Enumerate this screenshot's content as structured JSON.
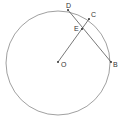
{
  "diagram": {
    "type": "geometry",
    "circle": {
      "center": "O",
      "cx": 58,
      "cy": 63,
      "r": 52,
      "stroke": "#888888"
    },
    "points": [
      {
        "label": "D",
        "x": 68,
        "y": 10,
        "lx": 66,
        "ly": 8
      },
      {
        "label": "C",
        "x": 89,
        "y": 19,
        "lx": 92,
        "ly": 17
      },
      {
        "label": "E",
        "x": 82,
        "y": 29,
        "lx": 74,
        "ly": 31
      },
      {
        "label": "O",
        "x": 58,
        "y": 62,
        "lx": 61,
        "ly": 67
      },
      {
        "label": "B",
        "x": 111,
        "y": 62,
        "lx": 113,
        "ly": 67
      }
    ],
    "segments": [
      {
        "from": "D",
        "to": "B"
      },
      {
        "from": "O",
        "to": "C"
      }
    ]
  }
}
